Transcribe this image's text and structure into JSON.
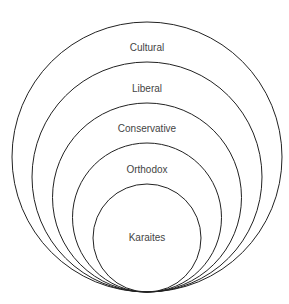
{
  "diagram": {
    "type": "nested-circles",
    "stroke_color": "#222222",
    "label_color": "#444444",
    "layers": [
      {
        "label": "Cultural",
        "cx": 147,
        "cy": 157,
        "r": 135,
        "label_y": 51
      },
      {
        "label": "Liberal",
        "cx": 147,
        "cy": 177,
        "r": 115,
        "label_y": 92
      },
      {
        "label": "Conservative",
        "cx": 147,
        "cy": 197.5,
        "r": 94.5,
        "label_y": 132
      },
      {
        "label": "Orthodox",
        "cx": 147,
        "cy": 217.5,
        "r": 74.5,
        "label_y": 173
      },
      {
        "label": "Karaites",
        "cx": 147,
        "cy": 238,
        "r": 54,
        "label_y": 241
      }
    ]
  }
}
